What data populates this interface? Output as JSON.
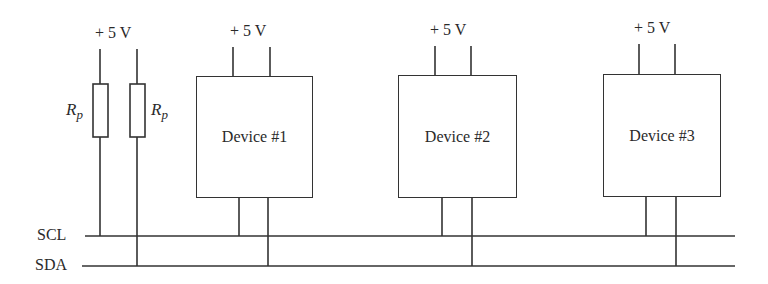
{
  "supply_labels": [
    "+ 5 V",
    "+ 5 V",
    "+ 5 V",
    "+ 5 V"
  ],
  "resistors": [
    {
      "symbol": "R",
      "subscript": "p"
    },
    {
      "symbol": "R",
      "subscript": "p"
    }
  ],
  "devices": [
    {
      "label": "Device #1"
    },
    {
      "label": "Device #2"
    },
    {
      "label": "Device #3"
    }
  ],
  "buses": {
    "scl": "SCL",
    "sda": "SDA"
  },
  "colors": {
    "line": "#333333",
    "background": "#ffffff"
  }
}
